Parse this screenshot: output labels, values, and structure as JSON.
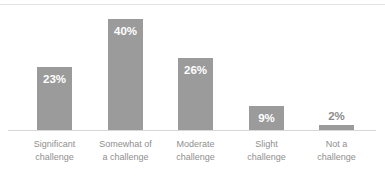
{
  "chart_data": {
    "type": "bar",
    "title": "",
    "subtitle": "",
    "xlabel": "",
    "ylabel": "",
    "ylim": [
      0,
      44
    ],
    "grid": false,
    "legend": null,
    "orientation": "vertical",
    "categories": [
      "Significant challenge",
      "Somewhat of a challenge",
      "Moderate challenge",
      "Slight challenge",
      "Not a challenge"
    ],
    "category_lines": [
      [
        "Significant",
        "challenge"
      ],
      [
        "Somewhat of",
        "a challenge"
      ],
      [
        "Moderate",
        "challenge"
      ],
      [
        "Slight",
        "challenge"
      ],
      [
        "Not a",
        "challenge"
      ]
    ],
    "values": [
      23,
      40,
      26,
      9,
      2
    ],
    "value_labels": [
      "23%",
      "40%",
      "26%",
      "9%",
      "2%"
    ],
    "label_placement": [
      "inside",
      "inside",
      "inside",
      "inside",
      "outside"
    ],
    "bar_color": "#9b9b9b",
    "inside_label_color": "#ffffff",
    "outside_label_color": "#8c8c8c",
    "axis_line_color": "#d8d8d8",
    "top_rule_color": "#e3e3e3",
    "category_label_color": "#8f8f8f",
    "background_color": "#ffffff"
  }
}
